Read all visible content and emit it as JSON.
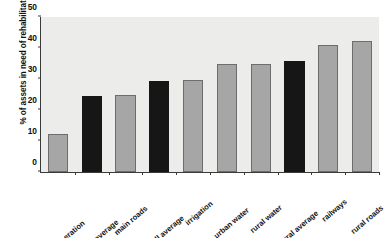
{
  "chart_data": {
    "type": "bar",
    "title": "",
    "xlabel": "",
    "ylabel": "% of assets in need of rehabilitation",
    "ylim": [
      0,
      50
    ],
    "yticks": [
      0,
      10,
      20,
      30,
      40,
      50
    ],
    "grid": false,
    "legend": "none",
    "categories": [
      "power generation",
      "nonrural average",
      "main roads",
      "overall average",
      "irrigation",
      "urban water",
      "rural water",
      "rural average",
      "railways",
      "rural roads"
    ],
    "values": [
      12.3,
      24.5,
      24.8,
      29.2,
      29.7,
      34.8,
      34.8,
      35.9,
      41.0,
      42.2
    ],
    "bar_colors": [
      "#a6a6a6",
      "#161616",
      "#a6a6a6",
      "#161616",
      "#a6a6a6",
      "#a6a6a6",
      "#a6a6a6",
      "#161616",
      "#a6a6a6",
      "#a6a6a6"
    ],
    "colors": {
      "bar_gray": "#a6a6a6",
      "bar_black": "#161616",
      "plot_background": "#ececea",
      "axis": "#3a3a3a",
      "text": "#111111",
      "figure_background": "#ffffff"
    }
  }
}
